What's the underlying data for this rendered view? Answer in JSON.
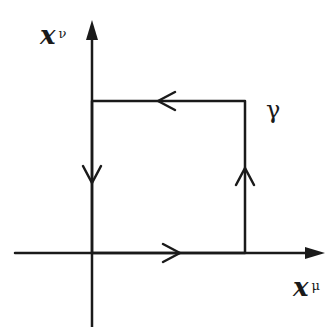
{
  "diagram": {
    "vertical_axis": {
      "label": "x",
      "superscript": "ν"
    },
    "horizontal_axis": {
      "label": "x",
      "superscript": "μ"
    },
    "curve": {
      "label": "γ",
      "shape": "rectangular closed loop",
      "orientation": "counter-clockwise"
    },
    "colors": {
      "ink": "#1a1a1a",
      "background": "#ffffff"
    }
  }
}
